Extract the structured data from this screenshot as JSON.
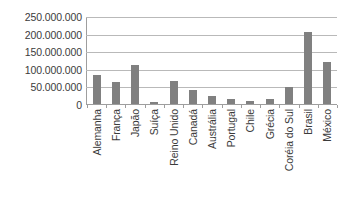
{
  "chart_data": {
    "type": "bar",
    "title": "",
    "subtitle": "",
    "xlabel": "",
    "ylabel": "",
    "categories": [
      "Alemanha",
      "França",
      "Japão",
      "Suíça",
      "Reino Unido",
      "Canadá",
      "Austrália",
      "Portugal",
      "Chile",
      "Grécia",
      "Coréia do Sul",
      "Brasil",
      "México"
    ],
    "values": [
      82000000,
      63000000,
      110000000,
      7000000,
      65000000,
      40000000,
      22000000,
      14000000,
      8000000,
      13000000,
      48000000,
      205000000,
      120000000
    ],
    "ylim": [
      0,
      250000000
    ],
    "ytick_values": [
      0,
      50000000,
      100000000,
      150000000,
      200000000,
      250000000
    ],
    "ytick_labels": [
      "250.000.000",
      "200.000.000",
      "150.000.000",
      "100.000.000",
      "50.000.000",
      "0"
    ],
    "grid": true,
    "legend": false,
    "legend_position": "none",
    "bar_color": "#808080",
    "gridline_color": "#b9b9b9",
    "axis_color": "#9e9e9e",
    "text_color": "#3b3b3b",
    "background_color": "#ffffff"
  }
}
